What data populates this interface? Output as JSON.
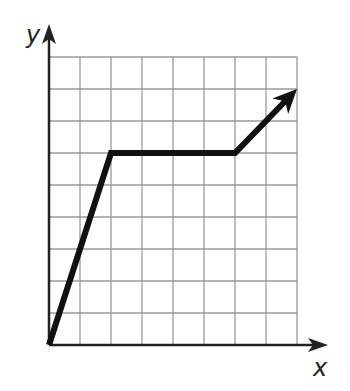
{
  "chart_data": {
    "type": "line",
    "title": "",
    "xlabel": "x",
    "ylabel": "y",
    "grid": true,
    "grid_columns": 8,
    "grid_rows": 9,
    "xlim": [
      0,
      8
    ],
    "ylim": [
      0,
      9
    ],
    "tick_labels": false,
    "series": [
      {
        "name": "piecewise",
        "points": [
          [
            0,
            0
          ],
          [
            2,
            6
          ],
          [
            6,
            6
          ],
          [
            8,
            8
          ]
        ],
        "end_arrow": true,
        "color": "#111111"
      }
    ]
  },
  "colors": {
    "grid": "#9a9a9a",
    "axis": "#222222",
    "line": "#111111"
  },
  "labels": {
    "x": "x",
    "y": "y"
  }
}
